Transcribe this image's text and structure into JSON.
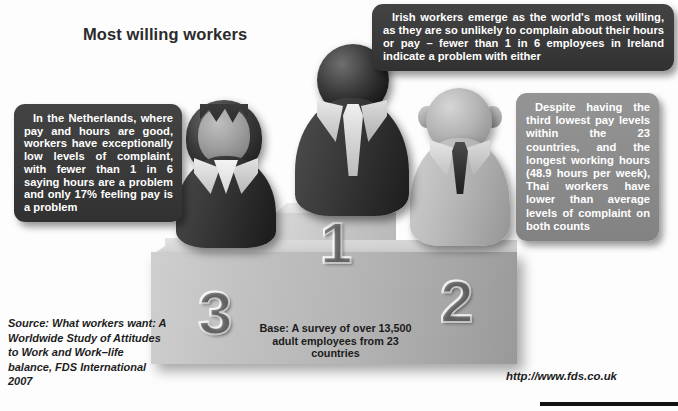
{
  "title": "Most willing workers",
  "callouts": {
    "netherlands": {
      "name": "netherlands-callout",
      "text": "In the Netherlands, where pay and hours are good, workers have exceptionally low levels of complaint, with fewer than 1 in 6 saying hours are a problem and only 17% feeling pay is a problem"
    },
    "ireland": {
      "name": "ireland-callout",
      "text": "Irish workers emerge as the world's most willing, as they are so unlikely to complain about their hours or pay – fewer than 1 in 6 employees in Ireland indicate a problem with either"
    },
    "thailand": {
      "name": "thailand-callout",
      "text": "Despite having the third lowest pay levels within the 23 countries, and the longest working hours (48.9 hours per week), Thai workers have lower than average levels of complaint on both counts"
    }
  },
  "podium": {
    "rank_first": "1",
    "rank_second": "2",
    "rank_third": "3",
    "base_caption": "Base: A survey of over 13,500 adult employees from 23 countries"
  },
  "source_note": "Source: What workers want: A Worldwide Study of Attitudes to Work and Work–life balance, FDS International 2007",
  "url": "http://www.fds.co.uk",
  "colors": {
    "callout_dark": "#3a3a3a",
    "callout_mid": "#8b8b8b",
    "podium_face": "#b3b3b3",
    "text_dark": "#1b1b1b",
    "background": "#ffffff"
  },
  "chart_data": {
    "type": "bar",
    "title": "Most willing workers",
    "xlabel": "",
    "ylabel": "Podium rank",
    "categories": [
      "Netherlands",
      "Ireland",
      "Thailand"
    ],
    "values": [
      3,
      1,
      2
    ],
    "series": [
      {
        "name": "Podium placement (rank)",
        "values": [
          3,
          1,
          2
        ]
      }
    ],
    "annotations": [
      "In the Netherlands, where pay and hours are good, workers have exceptionally low levels of complaint, with fewer than 1 in 6 saying hours are a problem and only 17% feeling pay is a problem",
      "Irish workers emerge as the world's most willing, as they are so unlikely to complain about their hours or pay – fewer than 1 in 6 employees in Ireland indicate a problem with either",
      "Despite having the third lowest pay levels within the 23 countries, and the longest working hours (48.9 hours per week), Thai workers have lower than average levels of complaint on both counts"
    ],
    "base": "Base: A survey of over 13,500 adult employees from 23 countries",
    "source": "Source: What workers want: A Worldwide Study of Attitudes to Work and Work–life balance, FDS International 2007",
    "grid": false,
    "legend": "none"
  }
}
